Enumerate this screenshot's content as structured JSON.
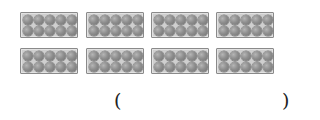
{
  "figure": {
    "trays": [
      {
        "row": 1,
        "col": 1,
        "eggs": 10,
        "x": 20,
        "y": 12
      },
      {
        "row": 1,
        "col": 2,
        "eggs": 10,
        "x": 86,
        "y": 12
      },
      {
        "row": 1,
        "col": 3,
        "eggs": 10,
        "x": 151,
        "y": 12
      },
      {
        "row": 1,
        "col": 4,
        "eggs": 10,
        "x": 216,
        "y": 12
      },
      {
        "row": 2,
        "col": 1,
        "eggs": 10,
        "x": 20,
        "y": 48
      },
      {
        "row": 2,
        "col": 2,
        "eggs": 10,
        "x": 86,
        "y": 48
      },
      {
        "row": 2,
        "col": 3,
        "eggs": 10,
        "x": 151,
        "y": 48
      },
      {
        "row": 2,
        "col": 4,
        "eggs": 10,
        "x": 216,
        "y": 48
      }
    ],
    "colors": {
      "tray_fill": "#cfcfcf",
      "tray_border": "#8a8a8a",
      "egg": "#8e8e8e"
    }
  },
  "answer": {
    "open_paren": "(",
    "close_paren": ")",
    "value": ""
  }
}
